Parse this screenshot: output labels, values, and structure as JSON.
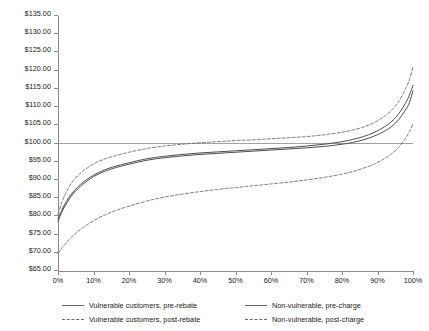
{
  "chart_data": {
    "type": "line",
    "title": "",
    "subtitle": "",
    "xlabel": "",
    "ylabel": "",
    "xlim": [
      0,
      100
    ],
    "ylim": [
      65,
      135
    ],
    "ytick_step": 5,
    "xtick_step": 10,
    "grid": false,
    "legend_position": "bottom",
    "x_tick_labels": [
      "0%",
      "10%",
      "20%",
      "30%",
      "40%",
      "50%",
      "60%",
      "70%",
      "80%",
      "90%",
      "100%"
    ],
    "y_tick_labels": [
      "$65.00",
      "$70.00",
      "$75.00",
      "$80.00",
      "$85.00",
      "$90.00",
      "$95.00",
      "$100.00",
      "$105.00",
      "$110.00",
      "$115.00",
      "$120.00",
      "$125.00",
      "$130.00",
      "$135.00"
    ],
    "y_tick_values": [
      65,
      70,
      75,
      80,
      85,
      90,
      95,
      100,
      105,
      110,
      115,
      120,
      125,
      130,
      135
    ],
    "x_tick_values": [
      0,
      10,
      20,
      30,
      40,
      50,
      60,
      70,
      80,
      90,
      100
    ],
    "reference_line": {
      "name": "baseline-100",
      "axis": "y",
      "value": 100,
      "label": "$100.00",
      "style": "solid",
      "color": "#8a8a8a"
    },
    "x": [
      0,
      1,
      2,
      3,
      4,
      5,
      7,
      10,
      13,
      16,
      20,
      25,
      30,
      35,
      40,
      45,
      50,
      55,
      60,
      65,
      70,
      75,
      80,
      83,
      86,
      89,
      92,
      94,
      96,
      98,
      99,
      100
    ],
    "series": [
      {
        "name": "Vulnerable customers, pre-rebate",
        "key": "vulnerable_pre_rebate",
        "style": "solid",
        "color": "#4d4d4d",
        "values": [
          79.3,
          81.6,
          83.5,
          85.1,
          86.4,
          87.5,
          89.3,
          91.3,
          92.7,
          93.7,
          94.7,
          95.8,
          96.5,
          97.0,
          97.4,
          97.7,
          98.0,
          98.3,
          98.6,
          98.9,
          99.3,
          99.8,
          100.5,
          101.1,
          101.9,
          103.0,
          104.6,
          106.1,
          108.2,
          111.3,
          113.3,
          116.0
        ]
      },
      {
        "name": "Vulnerable customers, post-rebate",
        "key": "vulnerable_post_rebate",
        "style": "dashed",
        "color": "#6b6b6b",
        "values": [
          80.6,
          83.6,
          86.0,
          87.9,
          89.4,
          90.6,
          92.4,
          94.4,
          95.7,
          96.6,
          97.6,
          98.6,
          99.3,
          99.8,
          100.2,
          100.5,
          100.8,
          101.0,
          101.3,
          101.6,
          101.9,
          102.4,
          103.1,
          103.7,
          104.5,
          105.7,
          107.5,
          109.2,
          111.6,
          115.2,
          117.6,
          121.0
        ]
      },
      {
        "name": "Non-vulnerable, pre-charge",
        "key": "non_vulnerable_pre_charge",
        "style": "solid",
        "color": "#4d4d4d",
        "values": [
          78.6,
          81.0,
          82.9,
          84.5,
          85.9,
          87.0,
          88.8,
          90.9,
          92.3,
          93.3,
          94.3,
          95.4,
          96.1,
          96.6,
          97.0,
          97.3,
          97.6,
          97.9,
          98.2,
          98.5,
          98.8,
          99.2,
          99.8,
          100.3,
          101.0,
          102.0,
          103.4,
          104.7,
          106.6,
          109.4,
          111.2,
          114.5
        ]
      },
      {
        "name": "Non-vulnerable, post-charge",
        "key": "non_vulnerable_post_charge",
        "style": "dashed",
        "color": "#6b6b6b",
        "values": [
          69.8,
          71.2,
          72.4,
          73.5,
          74.5,
          75.4,
          76.9,
          78.8,
          80.3,
          81.5,
          82.8,
          84.2,
          85.3,
          86.1,
          86.8,
          87.4,
          87.9,
          88.4,
          88.9,
          89.4,
          90.0,
          90.7,
          91.6,
          92.3,
          93.2,
          94.3,
          95.9,
          97.2,
          99.0,
          101.6,
          103.3,
          105.5
        ]
      }
    ]
  },
  "legend": {
    "items": [
      {
        "label": "Vulnerable customers, pre-rebate",
        "style": "solid"
      },
      {
        "label": "Non-vulnerable, pre-charge",
        "style": "solid"
      },
      {
        "label": "Vulnerable customers, post-rebate",
        "style": "dashed"
      },
      {
        "label": "Non-vulnerable, post-charge",
        "style": "dashed"
      }
    ]
  },
  "colors": {
    "axis": "#8a8a8a",
    "solid_series": "#4d4d4d",
    "dashed_series": "#6b6b6b",
    "text": "#1a1a1a",
    "background": "#ffffff"
  }
}
